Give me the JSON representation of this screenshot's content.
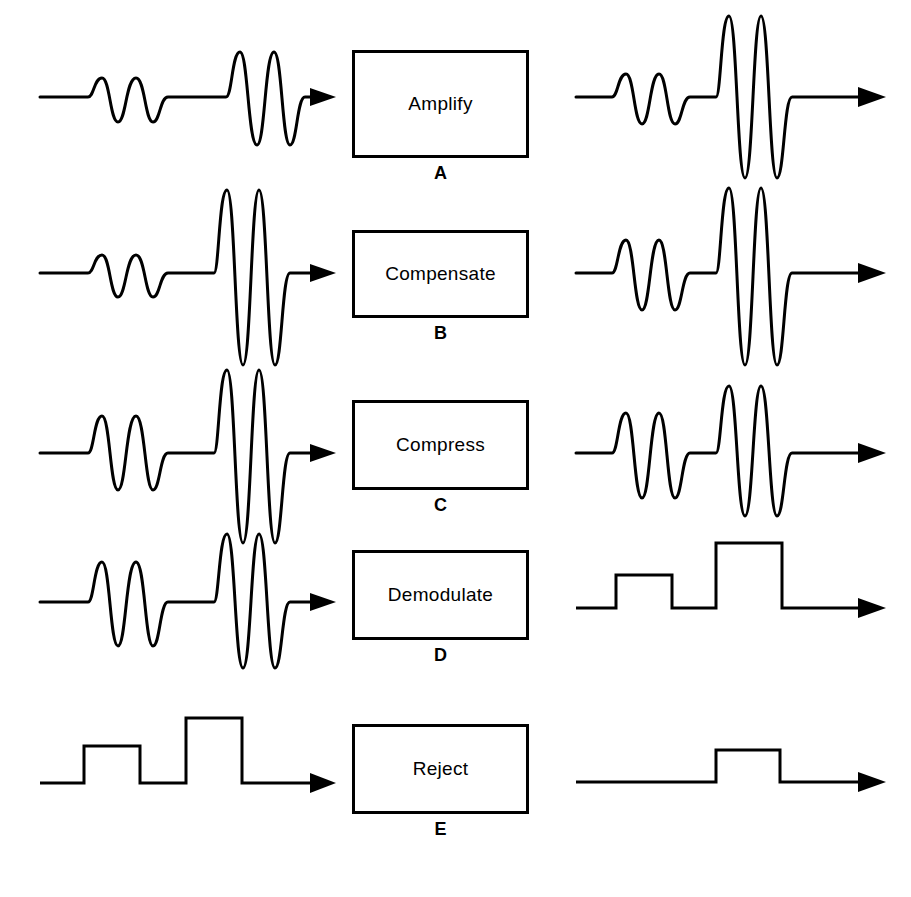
{
  "figure": {
    "stroke_color": "#000000",
    "background_color": "#ffffff"
  },
  "stages": [
    {
      "id": "stage-a",
      "letter": "A",
      "box_label": "Amplify",
      "input_waveform": {
        "name": "raw-echo-signal",
        "kind": "rf-burst",
        "description": "Two radio-frequency echo bursts on a flat baseline; a small-amplitude burst followed by a larger-amplitude burst",
        "packets": [
          {
            "name": "near-echo",
            "amplitude": "small",
            "cycles": 2
          },
          {
            "name": "far-echo",
            "amplitude": "medium",
            "cycles": 2
          }
        ]
      },
      "output_waveform": {
        "name": "amplified-echo-signal",
        "kind": "rf-burst",
        "description": "Both bursts uniformly amplified; the larger burst now greatly exceeds the display range",
        "packets": [
          {
            "name": "near-echo",
            "amplitude": "small",
            "cycles": 2
          },
          {
            "name": "far-echo",
            "amplitude": "very-large",
            "cycles": 2
          }
        ]
      }
    },
    {
      "id": "stage-b",
      "letter": "B",
      "box_label": "Compensate",
      "input_waveform": {
        "name": "amplified-echo-signal",
        "kind": "rf-burst",
        "description": "Small near burst and clipped-tall far burst",
        "packets": [
          {
            "name": "near-echo",
            "amplitude": "small",
            "cycles": 2
          },
          {
            "name": "far-echo",
            "amplitude": "very-large",
            "cycles": 2
          }
        ]
      },
      "output_waveform": {
        "name": "depth-compensated-signal",
        "kind": "rf-burst",
        "description": "Near burst boosted by time-gain compensation; far burst unchanged and still very tall",
        "packets": [
          {
            "name": "near-echo",
            "amplitude": "medium",
            "cycles": 2
          },
          {
            "name": "far-echo",
            "amplitude": "very-large",
            "cycles": 2
          }
        ]
      }
    },
    {
      "id": "stage-c",
      "letter": "C",
      "box_label": "Compress",
      "input_waveform": {
        "name": "depth-compensated-signal",
        "kind": "rf-burst",
        "description": "Medium near burst and very tall far burst",
        "packets": [
          {
            "name": "near-echo",
            "amplitude": "medium",
            "cycles": 2
          },
          {
            "name": "far-echo",
            "amplitude": "very-large",
            "cycles": 2
          }
        ]
      },
      "output_waveform": {
        "name": "compressed-signal",
        "kind": "rf-burst",
        "description": "Dynamic range reduced; both bursts brought to comparable, moderate amplitudes",
        "packets": [
          {
            "name": "near-echo",
            "amplitude": "medium",
            "cycles": 2
          },
          {
            "name": "far-echo",
            "amplitude": "large",
            "cycles": 2
          }
        ]
      }
    },
    {
      "id": "stage-d",
      "letter": "D",
      "box_label": "Demodulate",
      "input_waveform": {
        "name": "compressed-signal",
        "kind": "rf-burst",
        "description": "Two compressed bursts of similar moderate amplitude",
        "packets": [
          {
            "name": "near-echo",
            "amplitude": "medium",
            "cycles": 2
          },
          {
            "name": "far-echo",
            "amplitude": "large",
            "cycles": 2
          }
        ]
      },
      "output_waveform": {
        "name": "demodulated-envelope",
        "kind": "envelope-pulses",
        "description": "Rectified and smoothed into two rectangular video pulses; the second pulse is taller than the first",
        "pulses": [
          {
            "name": "near-echo-pulse",
            "height": "low"
          },
          {
            "name": "far-echo-pulse",
            "height": "high"
          }
        ]
      }
    },
    {
      "id": "stage-e",
      "letter": "E",
      "box_label": "Reject",
      "input_waveform": {
        "name": "demodulated-envelope",
        "kind": "envelope-pulses",
        "description": "Two rectangular video pulses, low then high",
        "pulses": [
          {
            "name": "near-echo-pulse",
            "height": "low"
          },
          {
            "name": "far-echo-pulse",
            "height": "high"
          }
        ]
      },
      "output_waveform": {
        "name": "rejected-envelope",
        "kind": "envelope-pulses",
        "description": "Low-level pulse removed by the reject threshold; only a single reduced pulse remains",
        "pulses": [
          {
            "name": "far-echo-pulse",
            "height": "low"
          }
        ]
      }
    }
  ]
}
